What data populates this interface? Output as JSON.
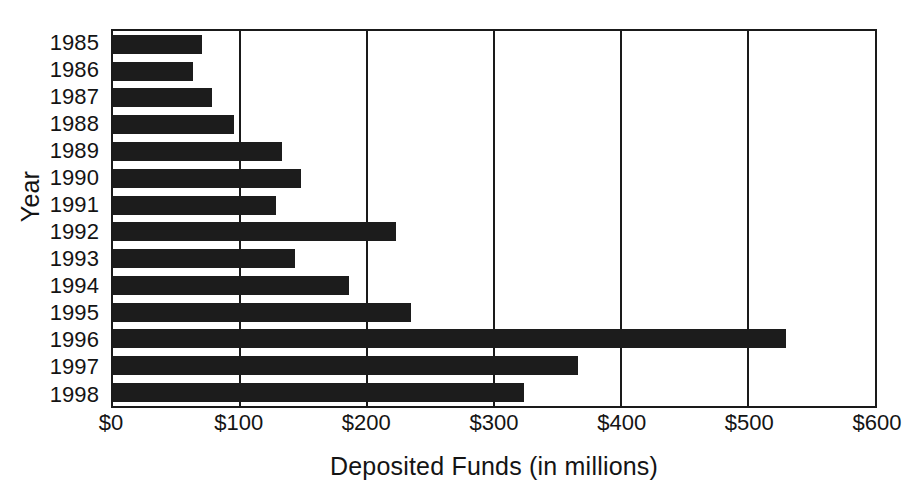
{
  "chart_data": {
    "type": "bar",
    "orientation": "horizontal",
    "title": "",
    "xlabel": "Deposited Funds (in millions)",
    "ylabel": "Year",
    "categories": [
      "1985",
      "1986",
      "1987",
      "1988",
      "1989",
      "1990",
      "1991",
      "1992",
      "1993",
      "1994",
      "1995",
      "1996",
      "1997",
      "1998"
    ],
    "values": [
      70,
      63,
      78,
      95,
      133,
      148,
      128,
      223,
      143,
      186,
      235,
      530,
      366,
      324
    ],
    "xlim": [
      0,
      600
    ],
    "ylim": null,
    "x_tick_values": [
      0,
      100,
      200,
      300,
      400,
      500,
      600
    ],
    "x_tick_labels": [
      "$0",
      "$100",
      "$200",
      "$300",
      "$400",
      "$500",
      "$600"
    ],
    "grid": "vertical",
    "legend": null,
    "bar_color": "#1c1c1c",
    "axis_color": "#1a1a1a",
    "background": "#ffffff"
  }
}
